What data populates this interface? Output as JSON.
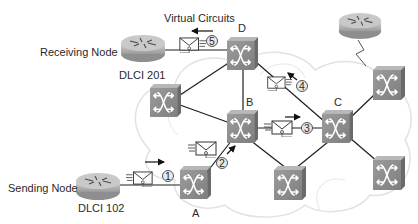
{
  "title": "Virtual Circuits",
  "colors": {
    "switch_face": "#8c8c8c",
    "switch_top": "#b4b4b4",
    "switch_side": "#6e6e6e",
    "router_body": "#bdbdbd",
    "cloud_outline": "#e4e4e4",
    "link": "#1e1e1e",
    "text": "#2a2a2a"
  },
  "nodes": {
    "receiving": {
      "label": "Receiving Node",
      "dlci": "DLCI 201"
    },
    "sending": {
      "label": "Sending Node",
      "dlci": "DLCI 102"
    }
  },
  "switches": {
    "a": {
      "label": "A"
    },
    "b": {
      "label": "B"
    },
    "c": {
      "label": "C"
    },
    "d": {
      "label": "D"
    }
  },
  "steps": [
    {
      "number": "1",
      "direction": "right"
    },
    {
      "number": "2",
      "direction": "up-right"
    },
    {
      "number": "3",
      "direction": "right"
    },
    {
      "number": "4",
      "direction": "up-left"
    },
    {
      "number": "5",
      "direction": "left"
    }
  ]
}
